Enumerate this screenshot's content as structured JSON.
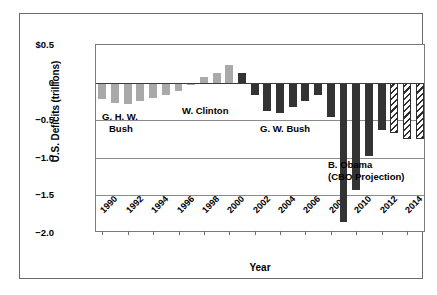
{
  "chart_data": {
    "type": "bar",
    "title": "",
    "xlabel": "Year",
    "ylabel": "U.S. Deficits (trillions)",
    "ylim": [
      -2.0,
      0.5
    ],
    "grid": true,
    "legend_position": "none",
    "y_ticks": [
      {
        "value": 0.5,
        "label": "$0.5"
      },
      {
        "value": 0.0,
        "label": "0"
      },
      {
        "value": -0.5,
        "label": "−0.5"
      },
      {
        "value": -1.0,
        "label": "−1.0"
      },
      {
        "value": -1.5,
        "label": "−1.5"
      },
      {
        "value": -2.0,
        "label": "−2.0"
      }
    ],
    "x_tick_labels": [
      "1990",
      "1992",
      "1994",
      "1996",
      "1998",
      "2000",
      "2002",
      "2004",
      "2006",
      "2008",
      "2010",
      "2012",
      "2014"
    ],
    "categories": [
      "1990",
      "1991",
      "1992",
      "1993",
      "1994",
      "1995",
      "1996",
      "1997",
      "1998",
      "1999",
      "2000",
      "2001",
      "2002",
      "2003",
      "2004",
      "2005",
      "2006",
      "2007",
      "2008",
      "2009",
      "2010",
      "2011",
      "2012",
      "2013",
      "2014",
      "2015"
    ],
    "values": [
      -0.22,
      -0.27,
      -0.29,
      -0.25,
      -0.2,
      -0.16,
      -0.11,
      -0.03,
      0.07,
      0.13,
      0.24,
      0.13,
      -0.16,
      -0.38,
      -0.41,
      -0.32,
      -0.25,
      -0.16,
      -0.46,
      -1.85,
      -1.43,
      -0.98,
      -0.63,
      -0.67,
      -0.75,
      -0.75
    ],
    "series_styles": [
      "light",
      "light",
      "light",
      "light",
      "light",
      "light",
      "light",
      "light",
      "light",
      "light",
      "light",
      "dark",
      "dark",
      "dark",
      "dark",
      "dark",
      "dark",
      "dark",
      "dark",
      "dark",
      "dark",
      "dark",
      "dark",
      "hatch",
      "hatch",
      "hatch"
    ],
    "colors": {
      "light_bar": "#a9a9a9",
      "dark_bar": "#333333",
      "hatch_bar": "#2e2e2e",
      "gridline": "#8a8a8a",
      "zeroline": "#3a3a3a",
      "axis": "#7a7a7a",
      "frame": "#6b6b6b",
      "text": "#000000",
      "background": "#ffffff"
    },
    "annotations": [
      {
        "name": "ghw-bush",
        "line1": "G. H. W.",
        "line2": "Bush"
      },
      {
        "name": "clinton",
        "line1": "W. Clinton",
        "line2": ""
      },
      {
        "name": "gw-bush",
        "line1": "G. W. Bush",
        "line2": ""
      },
      {
        "name": "obama",
        "line1": "B. Obama",
        "line2": "(CBO Projection)"
      }
    ]
  }
}
